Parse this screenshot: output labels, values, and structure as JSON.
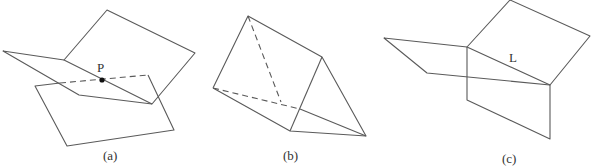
{
  "figures": [
    {
      "id": "a",
      "caption": "(a)",
      "point_label": "P",
      "description": "Two planes intersecting at a single point P"
    },
    {
      "id": "b",
      "caption": "(b)",
      "description": "Three planes forming a triangular prism with no common point"
    },
    {
      "id": "c",
      "caption": "(c)",
      "line_label": "L",
      "description": "Three planes intersecting along a common line L"
    }
  ],
  "colors": {
    "line": "#5a5a5a",
    "point": "#111111",
    "background": "#ffffff"
  }
}
